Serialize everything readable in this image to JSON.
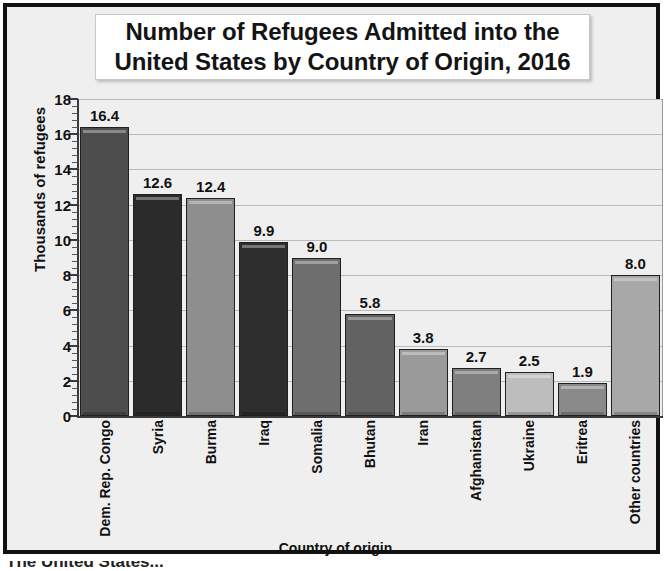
{
  "chart_data": {
    "type": "bar",
    "title": "Number of Refugees Admitted into the United States by Country of Origin, 2016",
    "title_lines": [
      "Number of Refugees Admitted into the",
      "United States by Country of Origin, 2016"
    ],
    "xlabel": "Country of origin",
    "ylabel": "Thousands of refugees",
    "ylim": [
      0,
      18
    ],
    "ytick_step": 2,
    "ytick_labels": [
      "18",
      "16",
      "14",
      "12",
      "10",
      "8",
      "6",
      "4",
      "2",
      "0"
    ],
    "ytick_values": [
      18,
      16,
      14,
      12,
      10,
      8,
      6,
      4,
      2,
      0
    ],
    "minor_ticks_per_interval": 4,
    "grid": "horizontal",
    "legend": "none",
    "categories": [
      "Dem. Rep. Congo",
      "Syria",
      "Burma",
      "Iraq",
      "Somalia",
      "Bhutan",
      "Iran",
      "Afghanistan",
      "Ukraine",
      "Eritrea",
      "Other countries"
    ],
    "values": [
      16.4,
      12.6,
      12.4,
      9.9,
      9.0,
      5.8,
      3.8,
      2.7,
      2.5,
      1.9,
      8.0
    ],
    "value_labels": [
      "16.4",
      "12.6",
      "12.4",
      "9.9",
      "9.0",
      "5.8",
      "3.8",
      "2.7",
      "2.5",
      "1.9",
      "8.0"
    ],
    "bar_colors": [
      "#4d4d4d",
      "#2b2b2b",
      "#8e8e8e",
      "#2e2e2e",
      "#6e6e6e",
      "#626262",
      "#9a9a9a",
      "#7f7f7f",
      "#bdbdbd",
      "#8a8a8a",
      "#a8a8a8"
    ]
  },
  "style": {
    "plot_background": "#efefef",
    "frame_color": "#111111",
    "gridline_color": "#b9b9b9",
    "axis_color": "#3a3a3a",
    "text_color": "#111111"
  },
  "caption": {
    "cut_off_text": "The United States..."
  }
}
